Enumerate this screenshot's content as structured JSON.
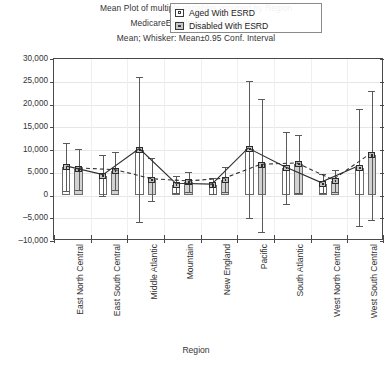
{
  "titles": {
    "line1": "Mean Plot of multiple variables grouped by  Region",
    "line2": "MedicareEnrollment 2012 21v*51c",
    "line3": "Mean; Whisker: Mean±0.95 Conf. Interval"
  },
  "legend": {
    "position": "top-right-inside",
    "entries": [
      {
        "label": "Aged With ESRD",
        "marker": "open-square-marker",
        "color": "#ffffff"
      },
      {
        "label": "Disabled With ESRD",
        "marker": "filled-square-marker",
        "color": "#d2d2d2"
      }
    ]
  },
  "axes": {
    "xlabel": "Region",
    "ylabel": "",
    "yticks": [
      "30,000",
      "25,000",
      "20,000",
      "15,000",
      "10,000",
      "5,000",
      "0",
      "–5,000",
      "–10,000"
    ],
    "ylim": [
      -10000,
      30000
    ],
    "grid": true
  },
  "chart_data": {
    "type": "bar",
    "title": "Mean Plot of multiple variables grouped by  Region",
    "subtitle": "MedicareEnrollment 2012 21v*51c",
    "annotation": "Mean; Whisker: Mean±0.95 Conf. Interval",
    "xlabel": "Region",
    "ylabel": "",
    "ylim": [
      -10000,
      30000
    ],
    "ytick_values": [
      30000,
      25000,
      20000,
      15000,
      10000,
      5000,
      0,
      -5000,
      -10000
    ],
    "grid": true,
    "legend_position": "top-right-inside",
    "categories": [
      "East North Central",
      "East South Central",
      "Middle Atlantic",
      "Mountain",
      "New England",
      "Pacific",
      "South Atlantic",
      "West North Central",
      "West South Central"
    ],
    "series": [
      {
        "name": "Aged With ESRD",
        "marker": "open-square-marker",
        "line": "solid",
        "fill": "#ffffff",
        "values": [
          6200,
          4300,
          10100,
          2400,
          2200,
          10200,
          6100,
          2600,
          6100
        ],
        "ci_upper": [
          11500,
          8800,
          26000,
          4300,
          3900,
          25200,
          14000,
          4700,
          19000
        ],
        "ci_lower": [
          900,
          -200,
          -5800,
          500,
          400,
          -5000,
          -1800,
          500,
          -6800
        ]
      },
      {
        "name": "Disabled With ESRD",
        "marker": "filled-square-marker",
        "line": "dashed",
        "fill": "#d2d2d2",
        "values": [
          5800,
          5400,
          3400,
          2900,
          3500,
          6600,
          6900,
          3200,
          8800
        ],
        "ci_upper": [
          10300,
          9600,
          8200,
          5100,
          6200,
          21200,
          13300,
          5600,
          23000
        ],
        "ci_lower": [
          1200,
          1100,
          -1300,
          700,
          800,
          -8000,
          500,
          800,
          -5400
        ]
      }
    ]
  }
}
